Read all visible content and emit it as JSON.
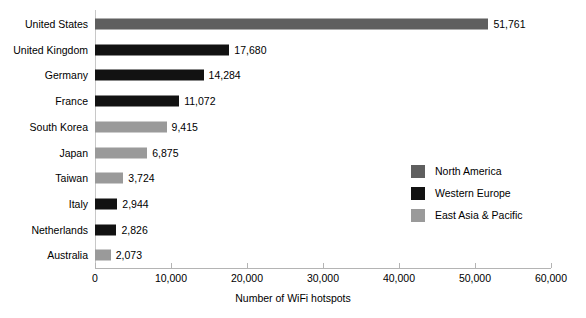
{
  "chart_data": {
    "type": "bar",
    "orientation": "horizontal",
    "title": "",
    "xlabel": "Number of WiFi hotspots",
    "ylabel": "",
    "xlim": [
      0,
      60000
    ],
    "grid": false,
    "legend_position": "right",
    "xticks": [
      "0",
      "10,000",
      "20,000",
      "30,000",
      "40,000",
      "50,000",
      "60,000"
    ],
    "xtick_values": [
      0,
      10000,
      20000,
      30000,
      40000,
      50000,
      60000
    ],
    "categories": [
      "United States",
      "United Kingdom",
      "Germany",
      "France",
      "South Korea",
      "Japan",
      "Taiwan",
      "Italy",
      "Netherlands",
      "Australia"
    ],
    "values": [
      51761,
      17680,
      14284,
      11072,
      9415,
      6875,
      3724,
      2944,
      2826,
      2073
    ],
    "value_labels": [
      "51,761",
      "17,680",
      "14,284",
      "11,072",
      "9,415",
      "6,875",
      "3,724",
      "2,944",
      "2,826",
      "2,073"
    ],
    "point_groups": [
      "north-america",
      "western-europe",
      "western-europe",
      "western-europe",
      "east-asia-pacific",
      "east-asia-pacific",
      "east-asia-pacific",
      "western-europe",
      "western-europe",
      "east-asia-pacific"
    ],
    "legend": [
      {
        "key": "north-america",
        "label": "North America",
        "color": "#5f5f5f"
      },
      {
        "key": "western-europe",
        "label": "Western Europe",
        "color": "#121212"
      },
      {
        "key": "east-asia-pacific",
        "label": "East Asia & Pacific",
        "color": "#9a9a9a"
      }
    ]
  }
}
